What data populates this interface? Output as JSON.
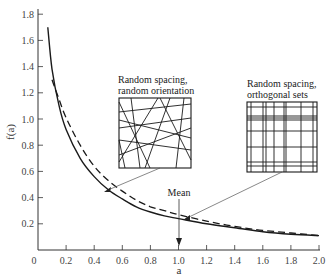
{
  "chart_data": {
    "type": "line",
    "title": "",
    "xlabel": "a",
    "ylabel": "f(a)",
    "xlim": [
      0,
      2.0
    ],
    "ylim": [
      0,
      1.8
    ],
    "x_ticks": [
      "0",
      "0.2",
      "0.4",
      "0.6",
      "0.8",
      "1.0",
      "1.2",
      "1.4",
      "1.6",
      "1.8",
      "2.0"
    ],
    "y_ticks": [
      "0.2",
      "0.4",
      "0.6",
      "0.8",
      "1.0",
      "1.2",
      "1.4",
      "1.6",
      "1.8"
    ],
    "grid": false,
    "series": [
      {
        "name": "Random spacing, random orientation",
        "style": "solid",
        "x": [
          0.07,
          0.1,
          0.15,
          0.2,
          0.3,
          0.4,
          0.5,
          0.6,
          0.7,
          0.8,
          0.9,
          1.0,
          1.2,
          1.4,
          1.6,
          1.8,
          2.0
        ],
        "y": [
          1.7,
          1.38,
          1.1,
          0.92,
          0.7,
          0.56,
          0.46,
          0.39,
          0.33,
          0.29,
          0.26,
          0.24,
          0.2,
          0.17,
          0.14,
          0.12,
          0.11
        ]
      },
      {
        "name": "Random spacing, orthogonal sets",
        "style": "dashed",
        "x": [
          0.1,
          0.15,
          0.2,
          0.3,
          0.4,
          0.5,
          0.6,
          0.7,
          0.8,
          0.9,
          1.0,
          1.2,
          1.4,
          1.6,
          1.8,
          2.0
        ],
        "y": [
          1.3,
          1.15,
          1.01,
          0.8,
          0.64,
          0.53,
          0.45,
          0.38,
          0.33,
          0.3,
          0.27,
          0.22,
          0.18,
          0.15,
          0.13,
          0.11
        ]
      }
    ],
    "annotations": [
      {
        "text": "Mean",
        "x": 1.0,
        "type": "arrow-down"
      },
      {
        "text": "Random spacing, random orientation",
        "points_to_series": 0,
        "at_x": 0.5
      },
      {
        "text": "Random spacing, orthogonal sets",
        "points_to_series": 1,
        "at_x": 1.05
      }
    ],
    "legend": "none (inset labels with pointer lines)"
  },
  "labels": {
    "y_axis": "f(a)",
    "x_axis": "a",
    "mean": "Mean",
    "inset_left_line1": "Random spacing,",
    "inset_left_line2": "random orientation",
    "inset_right_line1": "Random spacing,",
    "inset_right_line2": "orthogonal sets",
    "origin": "0"
  },
  "colors": {
    "line": "#1a1a1a",
    "axis": "#333333",
    "text": "#333333",
    "pointer": "#555555"
  }
}
